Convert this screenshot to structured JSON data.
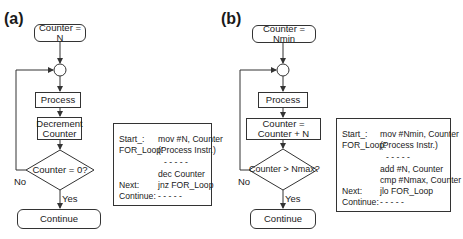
{
  "panels": {
    "a": {
      "label": "(a)",
      "init": "Counter = N",
      "process": "Process",
      "update_line1": "Decrement",
      "update_line2": "Counter",
      "decision": "Counter = 0?",
      "no_label": "No",
      "yes_label": "Yes",
      "end": "Continue",
      "code": [
        {
          "label": "Start_:",
          "instr": "mov  #N, Counter"
        },
        {
          "label": "FOR_Loop:",
          "instr": "(Process Instr.)"
        },
        {
          "label": "",
          "instr": "-  -  -  -  -"
        },
        {
          "label": "",
          "instr": "dec   Counter"
        },
        {
          "label": "Next:",
          "instr": "jnz    FOR_Loop"
        },
        {
          "label": "Continue:",
          "instr": "-  -  -  -  -"
        }
      ]
    },
    "b": {
      "label": "(b)",
      "init": "Counter = Nmin",
      "process": "Process",
      "update": "Counter = Counter + N",
      "decision": "Counter > Nmax?",
      "no_label": "No",
      "yes_label": "Yes",
      "end": "Continue",
      "code": [
        {
          "label": "Start_:",
          "instr": "mov  #Nmin, Counter"
        },
        {
          "label": "FOR_Loop:",
          "instr": "(Process Instr.)"
        },
        {
          "label": "",
          "instr": "-  -  -  -  -"
        },
        {
          "label": "",
          "instr": "add  #N, Counter"
        },
        {
          "label": "",
          "instr": "cmp  #Nmax, Counter"
        },
        {
          "label": "Next:",
          "instr": "jlo    FOR_Loop"
        },
        {
          "label": "Continue:",
          "instr": "-  -  -  -  -"
        }
      ]
    }
  },
  "colors": {
    "stroke": "#333333",
    "text": "#1a1a1a",
    "background": "#ffffff"
  }
}
